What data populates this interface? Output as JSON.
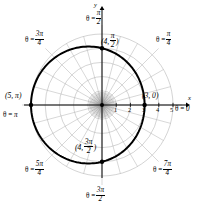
{
  "figure": {
    "background_color": "#ffffff",
    "curve_color": "#000000",
    "grid_color": "#b0b0b0",
    "axis_color": "#000000"
  },
  "axes": {
    "x_label": "x",
    "y_label": "y"
  },
  "ticks": {
    "x_positive": [
      "1",
      "2",
      "3",
      "4",
      "5"
    ]
  },
  "angle_labels": [
    {
      "id": "theta-pi-over-2",
      "eq": "θ =",
      "num": "π",
      "den": "2",
      "whole": null,
      "text": "θ = π/2"
    },
    {
      "id": "theta-pi-over-4",
      "eq": "θ =",
      "num": "π",
      "den": "4",
      "whole": null,
      "text": "θ = π/4"
    },
    {
      "id": "theta-3pi-over-4",
      "eq": "θ =",
      "num": "3π",
      "den": "4",
      "whole": null,
      "text": "θ = 3π/4"
    },
    {
      "id": "theta-pi",
      "eq": "θ =",
      "num": null,
      "den": null,
      "whole": "π",
      "text": "θ = π"
    },
    {
      "id": "theta-5pi-over-4",
      "eq": "θ =",
      "num": "5π",
      "den": "4",
      "whole": null,
      "text": "θ = 5π/4"
    },
    {
      "id": "theta-3pi-over-2",
      "eq": "θ =",
      "num": "3π",
      "den": "2",
      "whole": null,
      "text": "θ = 3π/2"
    },
    {
      "id": "theta-7pi-over-4",
      "eq": "θ =",
      "num": "7π",
      "den": "4",
      "whole": null,
      "text": "θ = 7π/4"
    },
    {
      "id": "theta-0",
      "eq": "θ =",
      "num": null,
      "den": null,
      "whole": "0",
      "text": "θ = 0"
    }
  ],
  "point_labels": [
    {
      "id": "point-4-pi-over-2",
      "open": "(4,",
      "num": "π",
      "den": "2",
      "close": ")",
      "text": "(4, π/2)"
    },
    {
      "id": "point-3-0",
      "open": "(3, 0)",
      "num": null,
      "den": null,
      "close": "",
      "text": "(3, 0)"
    },
    {
      "id": "point-5-pi",
      "open": "(5, π)",
      "num": null,
      "den": null,
      "close": "",
      "text": "(5, π)"
    },
    {
      "id": "point-4-3pi-over-2",
      "open": "(4,",
      "num": "3π",
      "den": "2",
      "close": ")",
      "text": "(4, 3π/2)"
    }
  ],
  "chart_data": {
    "type": "line",
    "coordinate_system": "polar",
    "equation": "r = 4 - cos(θ)",
    "xlabel": "x",
    "ylabel": "y",
    "grid": true,
    "legend": "none",
    "origin_px": [
      102,
      105
    ],
    "pixels_per_unit": 14.2,
    "radial_gridlines": [
      1,
      2,
      3,
      4,
      5
    ],
    "angular_gridlines_deg": [
      0,
      15,
      30,
      45,
      60,
      75,
      90,
      105,
      120,
      135,
      150,
      165,
      180,
      195,
      210,
      225,
      240,
      255,
      270,
      285,
      300,
      315,
      330,
      345
    ],
    "xlim": [
      -6.0,
      6.5
    ],
    "ylim": [
      -6.0,
      6.5
    ],
    "series": [
      {
        "name": "r = 4 - cos(theta)",
        "theta_deg": [
          0,
          15,
          30,
          45,
          60,
          75,
          90,
          105,
          120,
          135,
          150,
          165,
          180,
          195,
          210,
          225,
          240,
          255,
          270,
          285,
          300,
          315,
          330,
          345,
          360
        ],
        "r": [
          3.0,
          3.03,
          3.13,
          3.29,
          3.5,
          3.74,
          4.0,
          4.26,
          4.5,
          4.71,
          4.87,
          4.97,
          5.0,
          4.97,
          4.87,
          4.71,
          4.5,
          4.26,
          4.0,
          3.74,
          3.5,
          3.29,
          3.13,
          3.03,
          3.0
        ]
      }
    ],
    "marked_points": [
      {
        "label": "(3, 0)",
        "r": 3,
        "theta_deg": 0
      },
      {
        "label": "(4, π/2)",
        "r": 4,
        "theta_deg": 90
      },
      {
        "label": "(5, π)",
        "r": 5,
        "theta_deg": 180
      },
      {
        "label": "(4, 3π/2)",
        "r": 4,
        "theta_deg": 270
      }
    ]
  }
}
